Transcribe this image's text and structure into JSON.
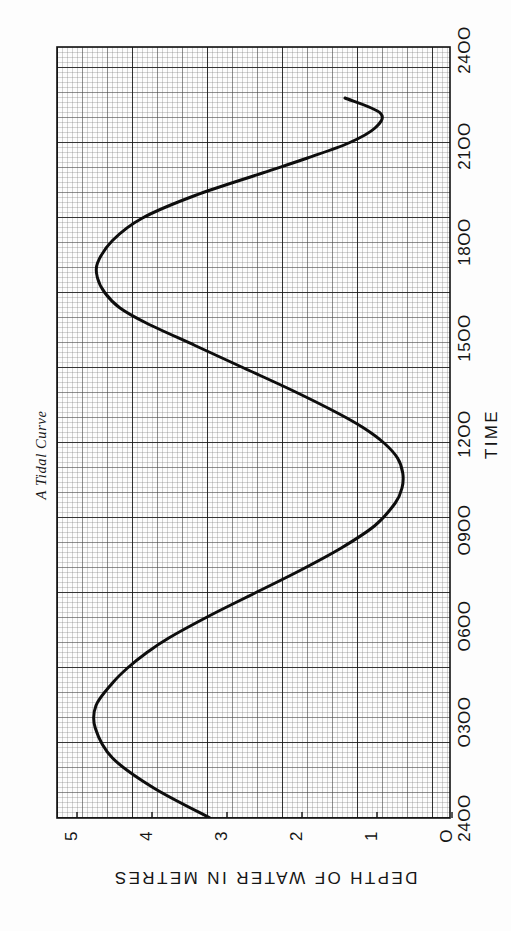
{
  "page": {
    "background": "#fdfdfd",
    "ink": "#151515"
  },
  "title": {
    "text": "A Tidal Curve"
  },
  "chart_data": {
    "type": "line",
    "title": "A Tidal Curve",
    "xlabel": "TIME",
    "ylabel": "DEPTH OF WATER IN METRES",
    "orientation": "rotated-90-ccw",
    "grid": "graph-paper: fine 0.1 unit, medium 0.5 unit, major 1 unit",
    "legend": "none",
    "xlim": [
      0,
      1440
    ],
    "ylim": [
      0,
      5.4
    ],
    "xticks": [
      0,
      180,
      360,
      540,
      720,
      900,
      1080,
      1260,
      1440
    ],
    "xtick_labels": [
      "2400",
      "O3OO",
      "O6OO",
      "O9OO",
      "12OO",
      "15OO",
      "18OO",
      "21OO",
      "24OO"
    ],
    "yticks": [
      0,
      1,
      2,
      3,
      4,
      5
    ],
    "ytick_labels": [
      "O",
      "1",
      "2",
      "3",
      "4",
      "5"
    ],
    "series": [
      {
        "name": "Tidal height",
        "x": [
          0,
          60,
          120,
          180,
          225,
          270,
          300,
          330,
          360,
          405,
          450,
          495,
          540,
          585,
          630,
          660,
          690,
          720,
          750,
          780,
          810,
          855,
          900,
          945,
          990,
          1020,
          1050,
          1080,
          1110,
          1155,
          1200,
          1245,
          1290,
          1320,
          1350,
          1380,
          1410,
          1440
        ],
        "y": [
          3.2,
          3.95,
          4.5,
          4.73,
          4.72,
          4.5,
          4.3,
          4.05,
          3.75,
          3.2,
          2.6,
          2.0,
          1.45,
          1.0,
          0.73,
          0.64,
          0.63,
          0.7,
          0.88,
          1.15,
          1.5,
          2.1,
          2.75,
          3.4,
          4.05,
          4.4,
          4.6,
          4.7,
          4.7,
          4.5,
          4.1,
          3.4,
          2.5,
          1.9,
          1.35,
          1.0,
          0.93,
          1.4
        ]
      }
    ],
    "annotations": {
      "high_tides": [
        {
          "time": "O2OO",
          "depth": 4.73
        },
        {
          "time": "145O",
          "depth": 4.7
        }
      ],
      "low_tides": [
        {
          "time": "1O2O",
          "depth": 0.63
        },
        {
          "time": "235O",
          "depth": 0.93
        }
      ]
    }
  },
  "axes": {
    "x": {
      "name": "TIME",
      "ticks": [
        {
          "value": 0,
          "label": "24OO"
        },
        {
          "value": 180,
          "label": "O3OO"
        },
        {
          "value": 360,
          "label": "O6OO"
        },
        {
          "value": 540,
          "label": "O9OO"
        },
        {
          "value": 720,
          "label": "12OO"
        },
        {
          "value": 900,
          "label": "15OO"
        },
        {
          "value": 1080,
          "label": "18OO"
        },
        {
          "value": 1260,
          "label": "21OO"
        },
        {
          "value": 1440,
          "label": "24OO"
        }
      ]
    },
    "y": {
      "name": "DEPTH OF WATER IN METRES",
      "ticks": [
        {
          "value": 0,
          "label": "O"
        },
        {
          "value": 1,
          "label": "1"
        },
        {
          "value": 2,
          "label": "2"
        },
        {
          "value": 3,
          "label": "3"
        },
        {
          "value": 4,
          "label": "4"
        },
        {
          "value": 5,
          "label": "5"
        }
      ]
    }
  }
}
